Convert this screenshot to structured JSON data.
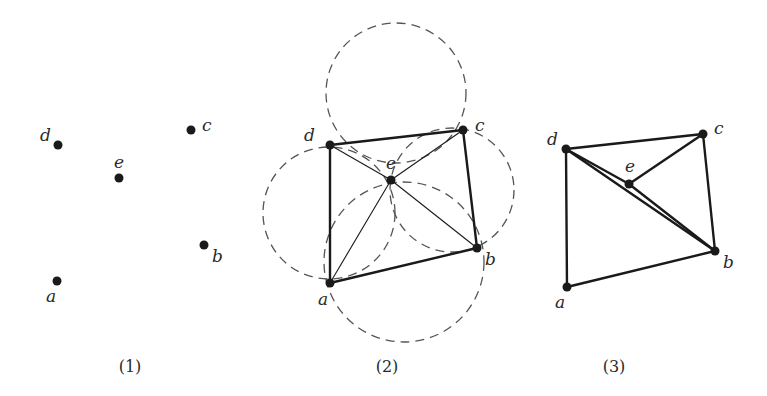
{
  "panels": [
    {
      "caption": "(1)",
      "points": {
        "a": {
          "x": 57,
          "y": 281,
          "label": "a",
          "lx": 46,
          "ly": 302
        },
        "b": {
          "x": 204,
          "y": 245,
          "label": "b",
          "lx": 212,
          "ly": 262
        },
        "c": {
          "x": 191,
          "y": 130,
          "label": "c",
          "lx": 202,
          "ly": 131
        },
        "d": {
          "x": 58,
          "y": 145,
          "label": "d",
          "lx": 40,
          "ly": 141
        },
        "e": {
          "x": 119,
          "y": 178,
          "label": "e",
          "lx": 114,
          "ly": 168
        }
      }
    },
    {
      "caption": "(2)",
      "points": {
        "a": {
          "x": 330,
          "y": 283,
          "label": "a",
          "lx": 318,
          "ly": 305
        },
        "b": {
          "x": 477,
          "y": 248,
          "label": "b",
          "lx": 485,
          "ly": 265
        },
        "c": {
          "x": 463,
          "y": 130,
          "label": "c",
          "lx": 475,
          "ly": 131
        },
        "d": {
          "x": 330,
          "y": 145,
          "label": "d",
          "lx": 304,
          "ly": 141
        },
        "e": {
          "x": 391,
          "y": 180,
          "label": "e",
          "lx": 386,
          "ly": 169
        }
      },
      "circles": [
        {
          "name": "circumcircle-dce",
          "cx": 396,
          "cy": 93,
          "r": 70
        },
        {
          "name": "circumcircle-dea",
          "cx": 329,
          "cy": 213,
          "r": 66
        },
        {
          "name": "circumcircle-ecb",
          "cx": 452,
          "cy": 190,
          "r": 62
        },
        {
          "name": "circumcircle-aeb",
          "cx": 404,
          "cy": 262,
          "r": 80
        }
      ]
    },
    {
      "caption": "(3)",
      "points": {
        "a": {
          "x": 567,
          "y": 287,
          "label": "a",
          "lx": 555,
          "ly": 308
        },
        "b": {
          "x": 715,
          "y": 251,
          "label": "b",
          "lx": 723,
          "ly": 268
        },
        "c": {
          "x": 703,
          "y": 134,
          "label": "c",
          "lx": 714,
          "ly": 134
        },
        "d": {
          "x": 566,
          "y": 149,
          "label": "d",
          "lx": 547,
          "ly": 145
        },
        "e": {
          "x": 629,
          "y": 184,
          "label": "e",
          "lx": 625,
          "ly": 172
        }
      }
    }
  ]
}
